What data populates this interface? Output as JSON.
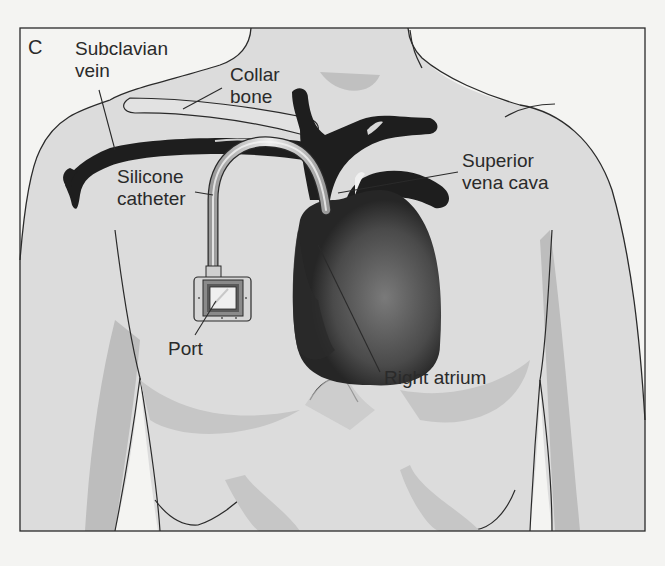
{
  "figure": {
    "panel_letter": "C",
    "colors": {
      "background": "#f4f4f2",
      "skin": "#dcdcdc",
      "skin_shadow": "#b9b9b9",
      "vessel": "#1e1e1e",
      "heart_light": "#6e6e6e",
      "outline": "#2a2a2a",
      "catheter": "#cfcfcf"
    }
  },
  "labels": {
    "subclavian_vein": "Subclavian\nvein",
    "collar_bone": "Collar\nbone",
    "silicone_catheter": "Silicone\ncatheter",
    "superior_vena_cava": "Superior\nvena cava",
    "port": "Port",
    "right_atrium": "Right atrium"
  }
}
